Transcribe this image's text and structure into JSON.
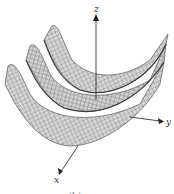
{
  "figure": {
    "type": "3d-surface-plot",
    "axes": {
      "x_label": "x",
      "y_label": "y",
      "z_label": "z"
    },
    "caption": "(b) ..."
  },
  "colors": {
    "surface_fill": "#d4d4d4",
    "surface_shade": "#9a9a9a",
    "mesh": "#5a5a5a",
    "axis": "#333333"
  }
}
